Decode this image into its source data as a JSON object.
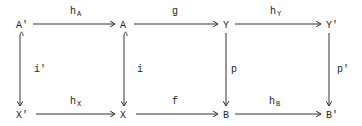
{
  "diagram": {
    "nodes": {
      "A_prime": "A'",
      "A": "A",
      "Y": "Y",
      "Y_prime": "Y'",
      "X_prime": "X'",
      "X": "X",
      "B": "B",
      "B_prime": "B'"
    },
    "arrows": {
      "hA": {
        "main": "h",
        "sub": "A"
      },
      "g": {
        "main": "g"
      },
      "hY": {
        "main": "h",
        "sub": "Y"
      },
      "hX": {
        "main": "h",
        "sub": "X"
      },
      "f": {
        "main": "f"
      },
      "hB": {
        "main": "h",
        "sub": "B"
      },
      "i_prime": {
        "main": "i'"
      },
      "i": {
        "main": "i"
      },
      "p": {
        "main": "p"
      },
      "p_prime": {
        "main": "p'"
      }
    }
  }
}
